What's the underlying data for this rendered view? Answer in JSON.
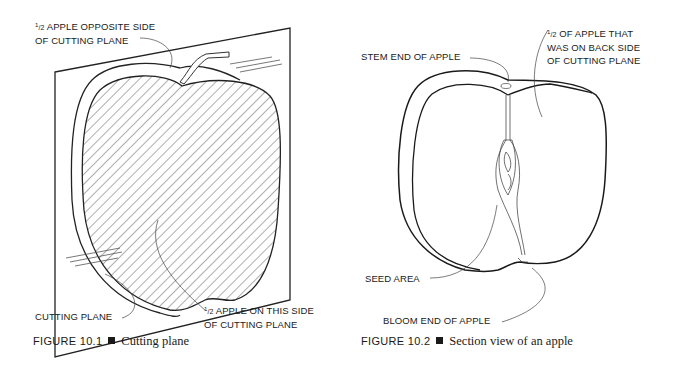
{
  "figures": [
    {
      "number": "FIGURE 10.1",
      "title": "Cutting plane",
      "labels": {
        "opposite_half_l1": "APPLE OPPOSITE SIDE",
        "opposite_half_l2": "OF CUTTING PLANE",
        "this_half_l1": "APPLE ON THIS SIDE",
        "this_half_l2": "OF CUTTING PLANE",
        "cutting_plane": "CUTTING PLANE",
        "fraction_num": "1",
        "fraction_den": "/2"
      }
    },
    {
      "number": "FIGURE 10.2",
      "title": "Section view of an apple",
      "labels": {
        "stem_end": "STEM END OF APPLE",
        "back_half_l1": "OF APPLE THAT",
        "back_half_l2": "WAS ON BACK SIDE",
        "back_half_l3": "OF CUTTING PLANE",
        "seed_area": "SEED AREA",
        "bloom_end": "BLOOM END OF APPLE",
        "fraction_num": "1",
        "fraction_den": "/2"
      }
    }
  ]
}
